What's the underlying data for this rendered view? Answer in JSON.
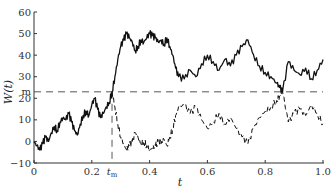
{
  "chart_data": {
    "type": "line",
    "title": "",
    "xlabel": "t",
    "ylabel": "W(t)",
    "xlim": [
      0,
      1.0
    ],
    "ylim": [
      -10,
      60
    ],
    "grid": false,
    "x_ticks": [
      {
        "value": 0,
        "label": "0"
      },
      {
        "value": 0.2,
        "label": "0.2"
      },
      {
        "value": 0.4,
        "label": "0.4"
      },
      {
        "value": 0.6,
        "label": "0.6"
      },
      {
        "value": 0.8,
        "label": "0.8"
      },
      {
        "value": 1.0,
        "label": "1.0"
      }
    ],
    "x_special_tick": {
      "value": 0.27,
      "label": "t",
      "subscript": "m"
    },
    "y_ticks": [
      {
        "value": -10,
        "label": "−10"
      },
      {
        "value": 0,
        "label": "0"
      },
      {
        "value": 10,
        "label": "10"
      },
      {
        "value": 20,
        "label": "20"
      },
      {
        "value": 30,
        "label": "30"
      },
      {
        "value": 40,
        "label": "40"
      },
      {
        "value": 50,
        "label": "50"
      },
      {
        "value": 60,
        "label": "60"
      }
    ],
    "y_special_tick": {
      "value": 23,
      "label": "m"
    },
    "reference_lines": [
      {
        "orientation": "horizontal",
        "value": 23,
        "label": "m",
        "style": "dashed"
      },
      {
        "orientation": "vertical",
        "value": 0.27,
        "label": "t_m",
        "style": "dashed"
      }
    ],
    "series": [
      {
        "name": "W(t)",
        "style": "solid",
        "x": [
          0,
          0.01,
          0.02,
          0.03,
          0.04,
          0.05,
          0.06,
          0.07,
          0.08,
          0.09,
          0.1,
          0.11,
          0.12,
          0.13,
          0.14,
          0.15,
          0.16,
          0.17,
          0.18,
          0.19,
          0.2,
          0.21,
          0.22,
          0.23,
          0.24,
          0.25,
          0.26,
          0.27,
          0.28,
          0.29,
          0.3,
          0.31,
          0.32,
          0.33,
          0.34,
          0.35,
          0.36,
          0.37,
          0.38,
          0.39,
          0.4,
          0.41,
          0.42,
          0.43,
          0.44,
          0.45,
          0.46,
          0.47,
          0.48,
          0.49,
          0.5,
          0.52,
          0.54,
          0.56,
          0.58,
          0.6,
          0.62,
          0.64,
          0.66,
          0.68,
          0.7,
          0.72,
          0.74,
          0.76,
          0.78,
          0.8,
          0.82,
          0.84,
          0.85,
          0.86,
          0.88,
          0.9,
          0.92,
          0.94,
          0.96,
          0.98,
          1.0
        ],
        "values": [
          0,
          -2,
          -4,
          -1,
          2,
          0,
          4,
          7,
          5,
          9,
          11,
          10,
          13,
          9,
          5,
          3,
          8,
          12,
          14,
          12,
          17,
          20,
          15,
          11,
          13,
          16,
          18,
          23,
          30,
          38,
          44,
          47,
          50,
          48,
          46,
          42,
          44,
          47,
          46,
          48,
          50,
          49,
          48,
          46,
          47,
          45,
          48,
          44,
          40,
          34,
          30,
          29,
          33,
          30,
          36,
          40,
          37,
          33,
          38,
          35,
          40,
          44,
          47,
          40,
          35,
          32,
          30,
          27,
          25,
          23,
          37,
          33,
          31,
          34,
          29,
          33,
          38
        ]
      },
      {
        "name": "Reflected W(t) after t_m",
        "style": "dashed",
        "x": [
          0.27,
          0.28,
          0.29,
          0.3,
          0.31,
          0.32,
          0.33,
          0.34,
          0.35,
          0.36,
          0.37,
          0.38,
          0.39,
          0.4,
          0.41,
          0.42,
          0.43,
          0.44,
          0.45,
          0.46,
          0.47,
          0.48,
          0.49,
          0.5,
          0.52,
          0.54,
          0.56,
          0.58,
          0.6,
          0.62,
          0.64,
          0.66,
          0.68,
          0.7,
          0.72,
          0.74,
          0.76,
          0.78,
          0.8,
          0.82,
          0.84,
          0.85,
          0.86,
          0.88,
          0.9,
          0.92,
          0.94,
          0.96,
          0.98,
          1.0
        ],
        "values": [
          23,
          16,
          8,
          2,
          -1,
          -4,
          -2,
          0,
          4,
          2,
          -1,
          0,
          -2,
          -4,
          -3,
          -2,
          0,
          -1,
          1,
          -2,
          2,
          6,
          12,
          16,
          17,
          13,
          16,
          10,
          6,
          9,
          13,
          8,
          11,
          6,
          2,
          -1,
          6,
          11,
          14,
          16,
          19,
          21,
          23,
          9,
          13,
          15,
          12,
          17,
          13,
          8
        ]
      }
    ]
  }
}
